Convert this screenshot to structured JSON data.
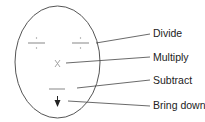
{
  "diagram": {
    "type": "long-division-mnemonic-face",
    "labels": [
      {
        "id": "divide",
        "text": "Divide",
        "symbol": "division-sign"
      },
      {
        "id": "multiply",
        "text": "Multiply",
        "symbol": "multiplication-sign"
      },
      {
        "id": "subtract",
        "text": "Subtract",
        "symbol": "minus-sign"
      },
      {
        "id": "bring-down",
        "text": "Bring down",
        "symbol": "down-arrow"
      }
    ],
    "colors": {
      "outline": "#555555",
      "symbols": "#9a9a9a",
      "leader_lines": "#444444",
      "arrow": "#222222",
      "text": "#222222"
    }
  }
}
